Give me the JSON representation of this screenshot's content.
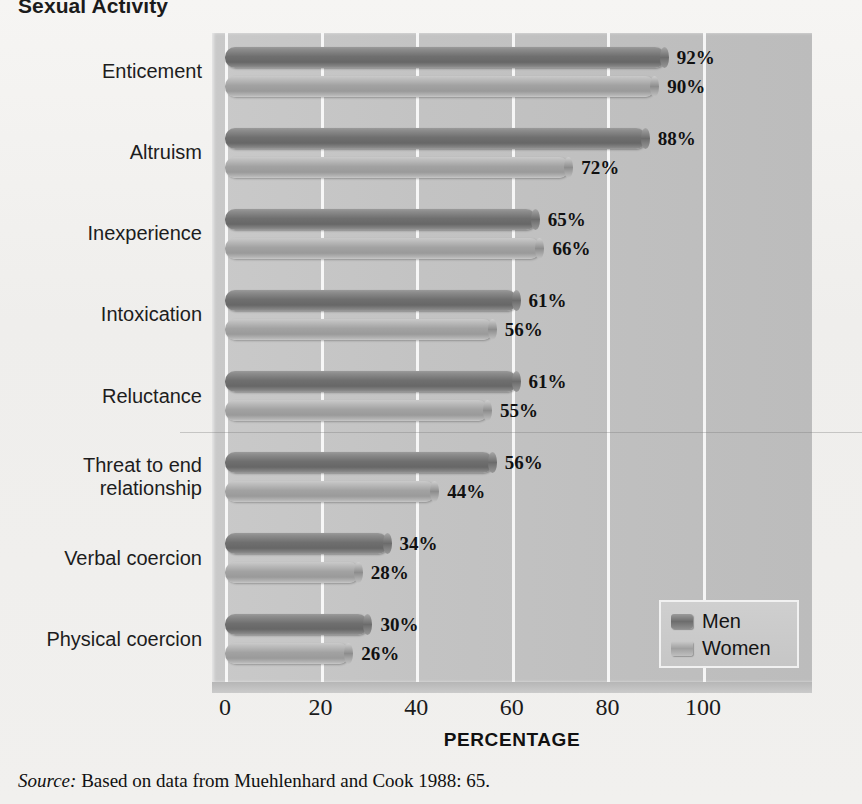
{
  "title": "Sexual Activity",
  "source": {
    "label": "Source:",
    "text": " Based on data from Muehlenhard and Cook 1988: 65."
  },
  "axis": {
    "x_title": "PERCENTAGE",
    "ticks": [
      "0",
      "20",
      "40",
      "60",
      "80",
      "100"
    ]
  },
  "legend": {
    "items": [
      {
        "label": "Men",
        "color": "#6f6f6f"
      },
      {
        "label": "Women",
        "color": "#a2a2a2"
      }
    ]
  },
  "chart_data": {
    "type": "bar",
    "orientation": "horizontal",
    "title": "Sexual Activity",
    "xlabel": "PERCENTAGE",
    "ylabel": "",
    "xlim": [
      0,
      100
    ],
    "xticks": [
      0,
      20,
      40,
      60,
      80,
      100
    ],
    "grid": true,
    "legend_position": "bottom-right",
    "categories": [
      "Enticement",
      "Altruism",
      "Inexperience",
      "Intoxication",
      "Reluctance",
      "Threat to end relationship",
      "Verbal coercion",
      "Physical coercion"
    ],
    "series": [
      {
        "name": "Men",
        "values": [
          92,
          88,
          65,
          61,
          61,
          56,
          34,
          30
        ]
      },
      {
        "name": "Women",
        "values": [
          90,
          72,
          66,
          56,
          55,
          44,
          28,
          26
        ]
      }
    ],
    "data_labels": [
      {
        "category": "Enticement",
        "men": "92%",
        "women": "90%"
      },
      {
        "category": "Altruism",
        "men": "88%",
        "women": "72%"
      },
      {
        "category": "Inexperience",
        "men": "65%",
        "women": "66%"
      },
      {
        "category": "Intoxication",
        "men": "61%",
        "women": "56%"
      },
      {
        "category": "Reluctance",
        "men": "61%",
        "women": "55%"
      },
      {
        "category": "Threat to end relationship",
        "men": "56%",
        "women": "44%"
      },
      {
        "category": "Verbal coercion",
        "men": "34%",
        "women": "28%"
      },
      {
        "category": "Physical coercion",
        "men": "30%",
        "women": "26%"
      }
    ],
    "category_label_lines": [
      [
        "Enticement"
      ],
      [
        "Altruism"
      ],
      [
        "Inexperience"
      ],
      [
        "Intoxication"
      ],
      [
        "Reluctance"
      ],
      [
        "Threat to end",
        "relationship"
      ],
      [
        "Verbal coercion"
      ],
      [
        "Physical coercion"
      ]
    ]
  }
}
